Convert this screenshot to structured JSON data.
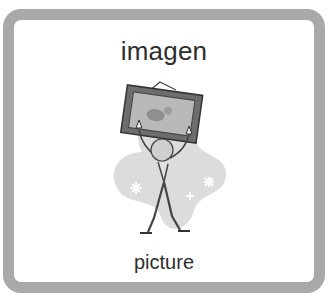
{
  "card": {
    "title": "imagen",
    "caption": "picture",
    "border_color": "#a9a9a9",
    "text_color": "#2e2e2e"
  },
  "illustration": {
    "icon": "person-holding-picture-frame-icon"
  }
}
